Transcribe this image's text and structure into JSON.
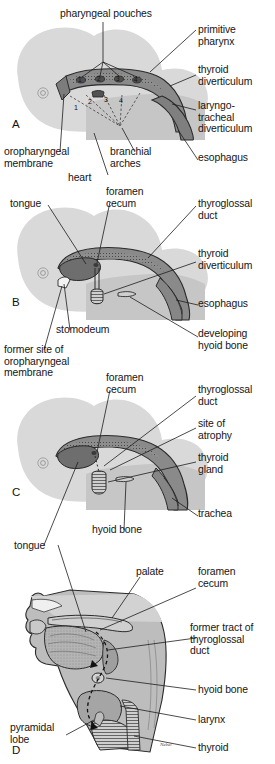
{
  "figure": {
    "panels": [
      {
        "id": "A",
        "letter": "A",
        "labels": [
          {
            "name": "pharyngeal-pouches",
            "text": "pharyngeal pouches"
          },
          {
            "name": "primitive-pharynx",
            "text": "primitive\npharynx"
          },
          {
            "name": "thyroid-diverticulum",
            "text": "thyroid\ndiverticulum"
          },
          {
            "name": "laryngotracheal-diverticulum",
            "text": "laryngo-\ntracheal\ndiverticulum"
          },
          {
            "name": "esophagus",
            "text": "esophagus"
          },
          {
            "name": "oropharyngeal-membrane",
            "text": "oropharyngeal\nmembrane"
          },
          {
            "name": "heart",
            "text": "heart"
          },
          {
            "name": "branchial-arches",
            "text": "branchial\narches"
          }
        ],
        "pouch_numbers": [
          "1",
          "2",
          "3",
          "4"
        ],
        "arch_numbers": [
          "1",
          "2",
          "3",
          "4"
        ]
      },
      {
        "id": "B",
        "letter": "B",
        "labels": [
          {
            "name": "tongue",
            "text": "tongue"
          },
          {
            "name": "foramen-cecum",
            "text": "foramen\ncecum"
          },
          {
            "name": "thyroglossal-duct",
            "text": "thyroglossal\nduct"
          },
          {
            "name": "thyroid-diverticulum",
            "text": "thyroid\ndiverticulum"
          },
          {
            "name": "esophagus",
            "text": "esophagus"
          },
          {
            "name": "stomodeum",
            "text": "stomodeum"
          },
          {
            "name": "developing-hyoid-bone",
            "text": "developing\nhyoid bone"
          },
          {
            "name": "former-site-oropharyngeal-membrane",
            "text": "former site of\noropharyngeal\nmembrane"
          }
        ]
      },
      {
        "id": "C",
        "letter": "C",
        "labels": [
          {
            "name": "foramen-cecum",
            "text": "foramen\ncecum"
          },
          {
            "name": "thyroglossal-duct",
            "text": "thyroglossal\nduct"
          },
          {
            "name": "site-of-atrophy",
            "text": "site of\natrophy"
          },
          {
            "name": "thyroid-gland",
            "text": "thyroid\ngland"
          },
          {
            "name": "trachea",
            "text": "trachea"
          },
          {
            "name": "hyoid-bone",
            "text": "hyoid bone"
          },
          {
            "name": "tongue",
            "text": "tongue"
          }
        ]
      },
      {
        "id": "D",
        "letter": "D",
        "labels": [
          {
            "name": "palate",
            "text": "palate"
          },
          {
            "name": "foramen-cecum",
            "text": "foramen\ncecum"
          },
          {
            "name": "former-tract-of-thyroglossal-duct",
            "text": "former tract of\nthyroglossal\nduct"
          },
          {
            "name": "hyoid-bone",
            "text": "hyoid bone"
          },
          {
            "name": "larynx",
            "text": "larynx"
          },
          {
            "name": "thyroid",
            "text": "thyroid"
          },
          {
            "name": "pyramidal-lobe",
            "text": "pyramidal\nlobe"
          }
        ],
        "signature": "Nebel"
      }
    ],
    "colors": {
      "embryo_head": "#d9d9d9",
      "embryo_trunk": "#c6c6c6",
      "tissue_mid": "#9a9a9a",
      "tissue_dark": "#6f6f6f",
      "outline": "#2b2b2b",
      "leader": "#1d1d1d",
      "background": "#ffffff"
    }
  }
}
